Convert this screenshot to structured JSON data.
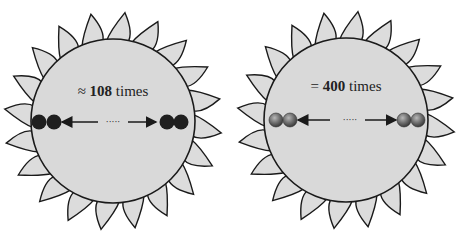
{
  "colors": {
    "disc_fill": "#d9d9d9",
    "ray_fill": "#dcdcdc",
    "outline": "#1a1a1a",
    "dark_sphere": "#1f1f1f",
    "gray_sphere": "#6e6e6e",
    "background": "#ffffff"
  },
  "diagrams": [
    {
      "id": "left-sun",
      "center": [
        113,
        121
      ],
      "radius": 82,
      "ray_count": 20,
      "label_prefix": "≈ ",
      "label_number": "108",
      "label_suffix": " times",
      "sphere_style": "dark",
      "ellipsis": "·····"
    },
    {
      "id": "right-sun",
      "center": [
        346,
        120
      ],
      "radius": 82,
      "ray_count": 20,
      "label_prefix": "= ",
      "label_number": "400",
      "label_suffix": " times",
      "sphere_style": "gray",
      "ellipsis": "·····"
    }
  ]
}
